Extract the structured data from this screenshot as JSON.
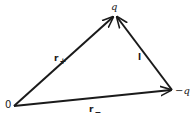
{
  "diagram": {
    "type": "vector-triangle",
    "points": {
      "origin": {
        "label": "0",
        "x": 14,
        "y": 106
      },
      "plus_charge": {
        "label": "q",
        "x": 115,
        "y": 15
      },
      "minus_charge": {
        "label": "−q",
        "x": 172,
        "y": 90
      }
    },
    "vectors": [
      {
        "id": "r_plus",
        "label_main": "r",
        "label_sub": "+",
        "from": "origin",
        "to": "plus_charge"
      },
      {
        "id": "r_minus",
        "label_main": "r",
        "label_sub": "−",
        "from": "origin",
        "to": "minus_charge"
      },
      {
        "id": "l",
        "label_main": "l",
        "label_sub": "",
        "from": "minus_charge",
        "to": "plus_charge"
      }
    ],
    "line_color": "#1a1a1a"
  }
}
